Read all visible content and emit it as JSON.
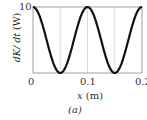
{
  "chart_data": {
    "type": "line",
    "title": "",
    "xlabel": "x (m)",
    "ylabel": "dK/dt (W)",
    "xlim": [
      0,
      0.2
    ],
    "ylim": [
      0,
      10
    ],
    "x_ticks": [
      "0",
      "0.1",
      "0.2"
    ],
    "y_ticks": [
      "0",
      "10"
    ],
    "grid": {
      "vertical_at": [
        0.05,
        0.1,
        0.15
      ],
      "horizontal": false
    },
    "series": [
      {
        "name": "dK/dt",
        "x": [
          0,
          0.025,
          0.05,
          0.075,
          0.1,
          0.125,
          0.15,
          0.175,
          0.2
        ],
        "values": [
          10,
          5,
          0,
          5,
          10,
          5,
          0,
          5,
          10
        ]
      }
    ],
    "caption": "(a)"
  },
  "labels": {
    "ylabel_var": "dK/ dt",
    "ylabel_unit": "(W)",
    "xlabel_var": "x",
    "xlabel_unit": "(m)",
    "tick_y_top": "10",
    "tick_x_0": "0",
    "tick_x_1": "0.1",
    "tick_x_2": "0.2",
    "caption": "(a)"
  }
}
